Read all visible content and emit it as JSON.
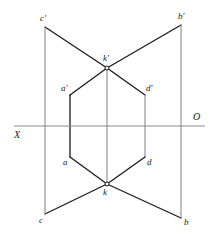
{
  "diagram": {
    "type": "descriptive-geometry-projection",
    "canvas": {
      "width": 215,
      "height": 242,
      "background": "#ffffff"
    },
    "colors": {
      "stroke_dark": "#1a1a1a",
      "stroke_gray": "#8a8a8a",
      "label_color": "#1a1a1a",
      "vertex_fill": "#ffffff"
    },
    "ground_line": {
      "name": "XO axis",
      "left_label": "X",
      "right_label": "O",
      "y": 126,
      "x_start": 14,
      "x_end": 205
    },
    "points": [
      {
        "id": "c-prime",
        "label": "c'",
        "x": 45,
        "y": 27,
        "label_x": 40,
        "label_y": 14
      },
      {
        "id": "b-prime",
        "label": "b'",
        "x": 181,
        "y": 25,
        "label_x": 178,
        "label_y": 12
      },
      {
        "id": "k-prime",
        "label": "k'",
        "x": 107,
        "y": 68,
        "label_x": 103,
        "label_y": 54
      },
      {
        "id": "a-prime",
        "label": "a'",
        "x": 70,
        "y": 95,
        "label_x": 61,
        "label_y": 84
      },
      {
        "id": "d-prime",
        "label": "d'",
        "x": 145,
        "y": 95,
        "label_x": 146,
        "label_y": 84
      },
      {
        "id": "a",
        "label": "a",
        "x": 70,
        "y": 157,
        "label_x": 63,
        "label_y": 158
      },
      {
        "id": "d",
        "label": "d",
        "x": 145,
        "y": 157,
        "label_x": 147,
        "label_y": 158
      },
      {
        "id": "k",
        "label": "k",
        "x": 107,
        "y": 184,
        "label_x": 103,
        "label_y": 188
      },
      {
        "id": "c",
        "label": "c",
        "x": 45,
        "y": 214,
        "label_x": 39,
        "label_y": 216
      },
      {
        "id": "b",
        "label": "b",
        "x": 181,
        "y": 218,
        "label_x": 184,
        "label_y": 218
      }
    ],
    "segments": [
      {
        "name": "c-prime-to-k-prime",
        "from": "c-prime",
        "to": "k-prime",
        "style": "dark"
      },
      {
        "name": "k-prime-to-b-prime",
        "from": "k-prime",
        "to": "b-prime",
        "style": "dark"
      },
      {
        "name": "a-prime-to-k-prime",
        "from": "a-prime",
        "to": "k-prime",
        "style": "dark"
      },
      {
        "name": "k-prime-to-d-prime",
        "from": "k-prime",
        "to": "d-prime",
        "style": "dark"
      },
      {
        "name": "a-prime-to-a",
        "from": "a-prime",
        "to": "a",
        "style": "dark"
      },
      {
        "name": "d-prime-to-d",
        "from": "d-prime",
        "to": "d",
        "style": "gray"
      },
      {
        "name": "a-to-k",
        "from": "a",
        "to": "k",
        "style": "dark"
      },
      {
        "name": "k-to-d",
        "from": "k",
        "to": "d",
        "style": "dark"
      },
      {
        "name": "c-to-k",
        "from": "c",
        "to": "k",
        "style": "dark"
      },
      {
        "name": "k-to-b",
        "from": "k",
        "to": "b",
        "style": "dark"
      },
      {
        "name": "c-prime-to-c",
        "from": "c-prime",
        "to": "c",
        "style": "gray"
      },
      {
        "name": "b-prime-to-b",
        "from": "b-prime",
        "to": "b",
        "style": "gray"
      },
      {
        "name": "k-prime-to-k",
        "from": "k-prime",
        "to": "k",
        "style": "gray"
      }
    ],
    "vertex_markers": [
      "k-prime",
      "k"
    ]
  }
}
